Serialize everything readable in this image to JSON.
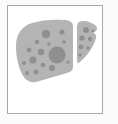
{
  "canvas": {
    "width": 118,
    "height": 124,
    "background_color": "#fbfbfb"
  },
  "frame": {
    "label": "image-frame",
    "x": 7,
    "y": 5,
    "width": 96,
    "height": 109,
    "border_color": "#a8a8a8",
    "border_width": 1,
    "fill_color": "#ffffff"
  },
  "illustration": {
    "name": "liver-icon",
    "alt_text": "Liver",
    "organ": "liver",
    "style": "flat-grayscale",
    "body_color": "#b4b4b4",
    "spot_color": "#8f8f8f",
    "lobes": [
      {
        "name": "left-lobe",
        "label": "Left lobe",
        "path": "M8 40 C8 28 14 20 24 17 C34 14 46 13 56 14 C62 14 65 16 65 21 L65 60 C65 64 63 66 59 67 L28 76 C22 77 17 74 14 68 C10 60 8 50 8 40 Z"
      },
      {
        "name": "right-lobe",
        "label": "Right lobe",
        "path": "M69 21 C69 17 71 15 75 15 C80 15 85 17 88 20 C90 22 89 25 86 26 L84 27 C87 27 89 29 88 32 C86 40 80 49 72 56 C70 58 69 57 69 54 Z"
      }
    ],
    "spots": [
      {
        "cx": 49,
        "cy": 49,
        "r": 8.5,
        "size": "large"
      },
      {
        "cx": 38,
        "cy": 28,
        "r": 4.2,
        "size": "medium"
      },
      {
        "cx": 54,
        "cy": 26,
        "r": 2.6,
        "size": "small"
      },
      {
        "cx": 29,
        "cy": 36,
        "r": 2.2,
        "size": "small"
      },
      {
        "cx": 21,
        "cy": 44,
        "r": 2.4,
        "size": "small"
      },
      {
        "cx": 33,
        "cy": 46,
        "r": 3.2,
        "size": "medium"
      },
      {
        "cx": 25,
        "cy": 54,
        "r": 3.6,
        "size": "medium"
      },
      {
        "cx": 16,
        "cy": 57,
        "r": 2.0,
        "size": "small"
      },
      {
        "cx": 35,
        "cy": 59,
        "r": 2.3,
        "size": "small"
      },
      {
        "cx": 44,
        "cy": 62,
        "r": 3.0,
        "size": "medium"
      },
      {
        "cx": 28,
        "cy": 66,
        "r": 2.4,
        "size": "small"
      },
      {
        "cx": 19,
        "cy": 67,
        "r": 1.9,
        "size": "small"
      },
      {
        "cx": 56,
        "cy": 36,
        "r": 1.8,
        "size": "small"
      },
      {
        "cx": 60,
        "cy": 56,
        "r": 1.6,
        "size": "small"
      },
      {
        "cx": 41,
        "cy": 38,
        "r": 1.7,
        "size": "small"
      },
      {
        "cx": 78,
        "cy": 24,
        "r": 3.0,
        "size": "medium"
      },
      {
        "cx": 74,
        "cy": 32,
        "r": 2.6,
        "size": "small"
      },
      {
        "cx": 82,
        "cy": 33,
        "r": 2.2,
        "size": "small"
      },
      {
        "cx": 73,
        "cy": 41,
        "r": 2.4,
        "size": "small"
      },
      {
        "cx": 80,
        "cy": 42,
        "r": 1.8,
        "size": "small"
      },
      {
        "cx": 72,
        "cy": 49,
        "r": 1.7,
        "size": "small"
      },
      {
        "cx": 85,
        "cy": 25,
        "r": 1.5,
        "size": "small"
      }
    ]
  }
}
